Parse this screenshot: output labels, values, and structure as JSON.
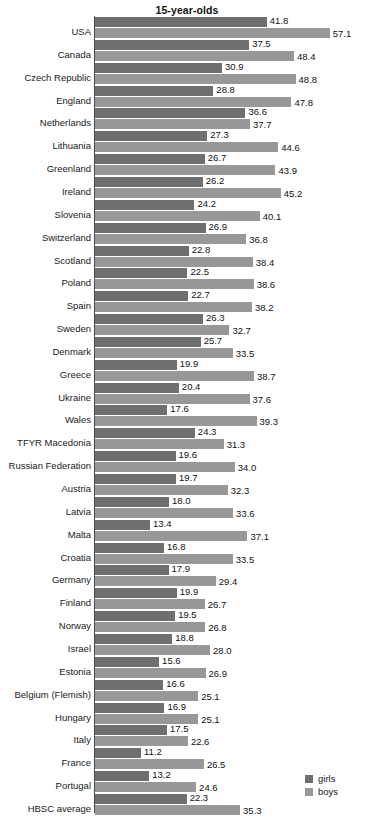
{
  "chart_data": {
    "type": "bar",
    "orientation": "horizontal",
    "title": "15-year-olds",
    "xlabel": "",
    "ylabel": "",
    "grid": false,
    "legend_position": "bottom-right",
    "xlim": [
      0,
      57.1
    ],
    "categories": [
      "USA",
      "Canada",
      "Czech Republic",
      "England",
      "Netherlands",
      "Lithuania",
      "Greenland",
      "Ireland",
      "Slovenia",
      "Switzerland",
      "Scotland",
      "Poland",
      "Spain",
      "Sweden",
      "Denmark",
      "Greece",
      "Ukraine",
      "Wales",
      "TFYR Macedonia",
      "Russian Federation",
      "Austria",
      "Latvia",
      "Malta",
      "Croatia",
      "Germany",
      "Finland",
      "Norway",
      "Israel",
      "Estonia",
      "Belgium (Flemish)",
      "Hungary",
      "Italy",
      "France",
      "Portugal",
      "HBSC average"
    ],
    "series": [
      {
        "name": "girls",
        "color": "#6f6f6f",
        "values": [
          41.8,
          37.5,
          30.9,
          28.8,
          36.6,
          27.3,
          26.7,
          26.2,
          24.2,
          26.9,
          22.8,
          22.5,
          22.7,
          26.3,
          25.7,
          19.9,
          20.4,
          17.6,
          24.3,
          19.6,
          19.7,
          18.0,
          13.4,
          16.8,
          17.9,
          19.9,
          19.5,
          18.8,
          15.6,
          16.6,
          16.9,
          17.5,
          11.2,
          13.2,
          22.3
        ],
        "labels": [
          "41.8",
          "37.5",
          "30.9",
          "28.8",
          "36.6",
          "27.3",
          "26.7",
          "26.2",
          "24.2",
          "26.9",
          "22.8",
          "22.5",
          "22.7",
          "26.3",
          "25.7",
          "19.9",
          "20.4",
          "17.6",
          "24.3",
          "19.6",
          "19.7",
          "18.0",
          "13.4",
          "16.8",
          "17.9",
          "19.9",
          "19.5",
          "18.8",
          "15.6",
          "16.6",
          "16.9",
          "17.5",
          "11.2",
          "13.2",
          "22.3"
        ]
      },
      {
        "name": "boys",
        "color": "#989898",
        "values": [
          57.1,
          48.4,
          48.8,
          47.8,
          37.7,
          44.6,
          43.9,
          45.2,
          40.1,
          36.8,
          38.4,
          38.6,
          38.2,
          32.7,
          33.5,
          38.7,
          37.6,
          39.3,
          31.3,
          34.0,
          32.3,
          33.6,
          37.1,
          33.5,
          29.4,
          26.7,
          26.8,
          28.0,
          26.9,
          25.1,
          25.1,
          22.6,
          26.5,
          24.6,
          35.3
        ],
        "labels": [
          "57.1",
          "48.4",
          "48.8",
          "47.8",
          "37.7",
          "44.6",
          "43.9",
          "45.2",
          "40.1",
          "36.8",
          "38.4",
          "38.6",
          "38.2",
          "32.7",
          "33.5",
          "38.7",
          "37.6",
          "39.3",
          "31.3",
          "34.0",
          "32.3",
          "33.6",
          "37.1",
          "33.5",
          "29.4",
          "26.7",
          "26.8",
          "28.0",
          "26.9",
          "25.1",
          "25.1",
          "22.6",
          "26.5",
          "24.6",
          "35.3"
        ]
      }
    ]
  },
  "legend": {
    "items": [
      {
        "label": "girls",
        "color": "#6f6f6f"
      },
      {
        "label": "boys",
        "color": "#989898"
      }
    ]
  }
}
